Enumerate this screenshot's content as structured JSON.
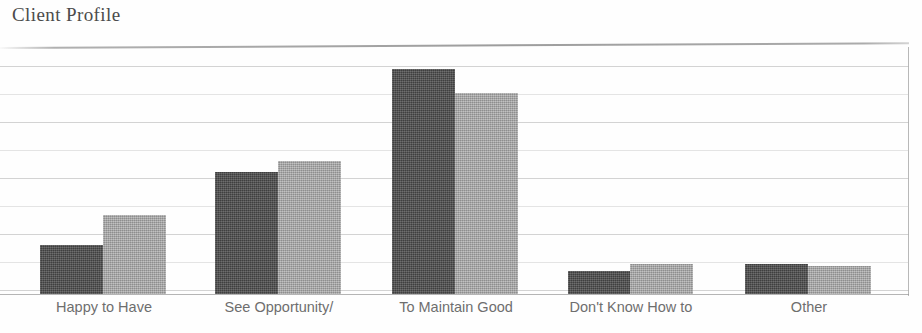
{
  "title": "Client Profile",
  "chart_data": {
    "type": "bar",
    "title": "Client Profile",
    "xlabel": "",
    "ylabel": "",
    "grid": true,
    "legend": "none",
    "gridline_count": 9,
    "axis_tick_labels": [],
    "categories": [
      "Happy to Have",
      "See Opportunity/",
      "To Maintain Good",
      "Don't Know How to",
      "Other"
    ],
    "category_second_lines": [
      "",
      "",
      "",
      "",
      ""
    ],
    "series": [
      {
        "name": "series-1-dark",
        "color": "#4d4d4d",
        "values": [
          20,
          50,
          92,
          9,
          12
        ]
      },
      {
        "name": "series-2-light",
        "color": "#a9a9a9",
        "values": [
          32,
          54,
          82,
          12,
          11
        ]
      }
    ],
    "ylim": [
      0,
      100
    ],
    "bar_pixel_tops": {
      "series-1-dark": [
        245,
        172,
        69,
        271,
        264
      ],
      "series-2-light": [
        215,
        161,
        93,
        264,
        266
      ]
    },
    "baseline_y": 294,
    "plot_top_y": 48
  },
  "colors": {
    "bar_dark": "#4d4d4d",
    "bar_light": "#a9a9a9",
    "gridline": "#afafaf",
    "label_text": "#6e6e6e",
    "title_text": "#4b4b4b",
    "background": "#fefefe"
  },
  "layout": {
    "gridlines_y": [
      19,
      47,
      75,
      103,
      131,
      159,
      187,
      215,
      243
    ],
    "groups": [
      {
        "dark_x": 40,
        "light_x": 103,
        "bar_w": 63,
        "label_center": 104,
        "label_width": 190
      },
      {
        "dark_x": 215,
        "light_x": 278,
        "bar_w": 63,
        "label_center": 279,
        "label_width": 200
      },
      {
        "dark_x": 392,
        "light_x": 455,
        "bar_w": 63,
        "label_center": 456,
        "label_width": 200
      },
      {
        "dark_x": 568,
        "light_x": 630,
        "bar_w": 63,
        "label_center": 631,
        "label_width": 210
      },
      {
        "dark_x": 745,
        "light_x": 808,
        "bar_w": 63,
        "label_center": 809,
        "label_width": 180
      }
    ]
  }
}
